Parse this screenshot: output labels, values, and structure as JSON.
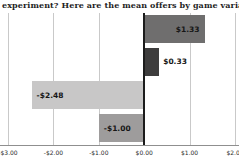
{
  "header": {
    "text": "experiment? Here are the mean offers by game variant:"
  },
  "chart_data": {
    "type": "bar",
    "orientation": "horizontal",
    "title": "",
    "xlabel": "",
    "ylabel": "",
    "xlim": [
      -3,
      2
    ],
    "grid": true,
    "bars": [
      {
        "label": "$1.33",
        "value": 1.33,
        "color": "#6f6e6e",
        "label_pos": "inside-right"
      },
      {
        "label": "$0.33",
        "value": 0.33,
        "color": "#3e3d3d",
        "label_pos": "outside-right"
      },
      {
        "label": "-$2.48",
        "value": -2.48,
        "color": "#c8c7c7",
        "label_pos": "inside-left"
      },
      {
        "label": "-$1.00",
        "value": -1.0,
        "color": "#9e9c9c",
        "label_pos": "inside-left"
      }
    ],
    "x_ticks": [
      {
        "label": "-$3.00",
        "value": -3
      },
      {
        "label": "-$2.00",
        "value": -2
      },
      {
        "label": "-$1.00",
        "value": -1
      },
      {
        "label": "$0.00",
        "value": 0
      },
      {
        "label": "$1.00",
        "value": 1
      },
      {
        "label": "$2.00",
        "value": 2
      }
    ],
    "label_color": "#161616",
    "gridline_color": "#c9c9c9",
    "zero_line_color": "#1c1c1c",
    "axis_line_color": "#8f8f8f"
  }
}
